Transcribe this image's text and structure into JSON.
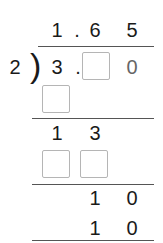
{
  "quotient": {
    "d1": "1",
    "dot": ".",
    "d2": "6",
    "d3": "5"
  },
  "divisor": "2",
  "bracket": ")",
  "dividend": {
    "d1": "3",
    "dot": ".",
    "d2_blank": "",
    "d3": "0"
  },
  "step1": {
    "blank": ""
  },
  "remainder1": {
    "d1": "1",
    "d2": "3"
  },
  "step2": {
    "blank1": "",
    "blank2": ""
  },
  "remainder2": {
    "d1": "1",
    "d2": "0"
  },
  "step3": {
    "d1": "1",
    "d2": "0"
  }
}
